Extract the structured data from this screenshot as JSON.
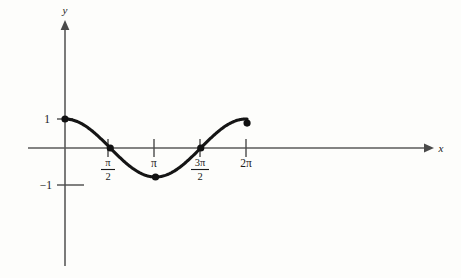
{
  "chart_data": {
    "type": "line",
    "title": "",
    "subtitle": "",
    "xlabel": "x",
    "ylabel": "y",
    "function": "y = cos x",
    "xlim": [
      -0.85,
      8.75
    ],
    "ylim": [
      -2.6,
      2.95
    ],
    "grid": false,
    "legend": null,
    "x_tick_labels": [
      "π/2",
      "π",
      "3π/2",
      "2π"
    ],
    "x_tick_values": [
      1.5708,
      3.1416,
      4.7124,
      6.2832
    ],
    "y_tick_labels": [
      "1",
      "−1"
    ],
    "y_tick_values": [
      1,
      -1
    ],
    "series": [
      {
        "name": "cos x",
        "color": "#151515",
        "x_start": 0,
        "x_end": 6.32,
        "x": [
          0,
          0.3142,
          0.6283,
          0.9425,
          1.2566,
          1.5708,
          1.885,
          2.1991,
          2.5133,
          2.8274,
          3.1416,
          3.4558,
          3.7699,
          4.0841,
          4.3982,
          4.7124,
          5.0265,
          5.3407,
          5.6549,
          5.969,
          6.2832
        ],
        "y": [
          1,
          0.951,
          0.809,
          0.588,
          0.309,
          0,
          -0.309,
          -0.588,
          -0.809,
          -0.951,
          -1,
          -0.951,
          -0.809,
          -0.588,
          -0.309,
          0,
          0.309,
          0.588,
          0.809,
          0.951,
          1
        ]
      }
    ],
    "marked_points": [
      {
        "label": "start",
        "x": 0,
        "y": 1
      },
      {
        "label": "zero-descending",
        "x": 1.5708,
        "y": 0
      },
      {
        "label": "minimum",
        "x": 3.1416,
        "y": -1
      },
      {
        "label": "zero-ascending",
        "x": 4.7124,
        "y": 0
      },
      {
        "label": "end",
        "x": 6.32,
        "y": 0.86
      }
    ]
  },
  "labels": {
    "y_axis": "y",
    "x_axis": "x",
    "y_one": "1",
    "y_neg_one": "−1",
    "pi_over_2_num": "π",
    "pi_over_2_den": "2",
    "pi": "π",
    "three_pi_over_2_num": "3π",
    "three_pi_over_2_den": "2",
    "two_pi": "2π"
  },
  "colors": {
    "curve": "#151515",
    "axis": "#5a5a5a",
    "text": "#1a1a1a",
    "background": "#fdfdfb"
  }
}
